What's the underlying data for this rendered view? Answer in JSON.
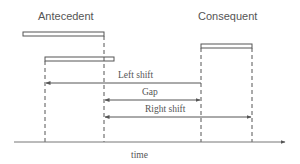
{
  "diagram": {
    "labels": {
      "antecedent": "Antecedent",
      "consequent": "Consequent",
      "left_shift": "Left shift",
      "gap": "Gap",
      "right_shift": "Right shift",
      "time_axis": "time"
    },
    "colors": {
      "line": "#555555",
      "bar_fill": "#ffffff",
      "background": "#ffffff"
    },
    "bars": [
      {
        "name": "antecedent-bar-1",
        "x1": 23,
        "x2": 104,
        "y": 32
      },
      {
        "name": "antecedent-bar-2",
        "x1": 45,
        "x2": 114,
        "y": 57
      },
      {
        "name": "consequent-bar",
        "x1": 201,
        "x2": 252,
        "y": 44
      }
    ],
    "guides_x": [
      45,
      104,
      201,
      252
    ],
    "arrows": [
      {
        "name": "left-shift-arrow",
        "from": 201,
        "to": 45,
        "y": 83,
        "bidirectional": false
      },
      {
        "name": "gap-arrow",
        "from": 104,
        "to": 201,
        "y": 100,
        "bidirectional": true
      },
      {
        "name": "right-shift-arrow",
        "from": 104,
        "to": 252,
        "y": 117,
        "bidirectional": true
      }
    ]
  }
}
